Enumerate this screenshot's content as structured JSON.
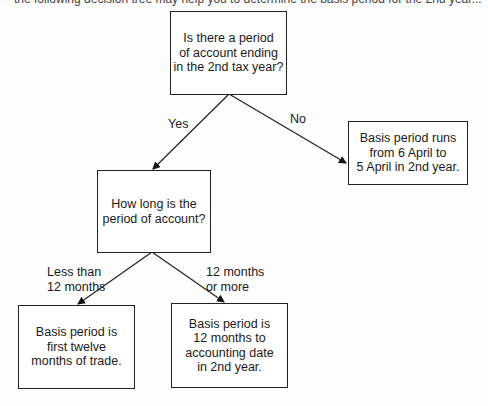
{
  "caption": "the following decision tree may help you to determine the basis period for the 2nd year...",
  "nodes": {
    "root": "Is there a period\nof account ending\nin the 2nd tax year?",
    "no_result": "Basis period runs\nfrom 6 April to\n5 April in 2nd year.",
    "length_question": "How long is the\nperiod of account?",
    "short_result": "Basis period is\nfirst twelve\nmonths of trade.",
    "long_result": "Basis period is\n12 months to\naccounting date\nin 2nd year."
  },
  "edges": {
    "yes": "Yes",
    "no": "No",
    "less": "Less than\n12 months",
    "more": "12 months\nor more"
  }
}
